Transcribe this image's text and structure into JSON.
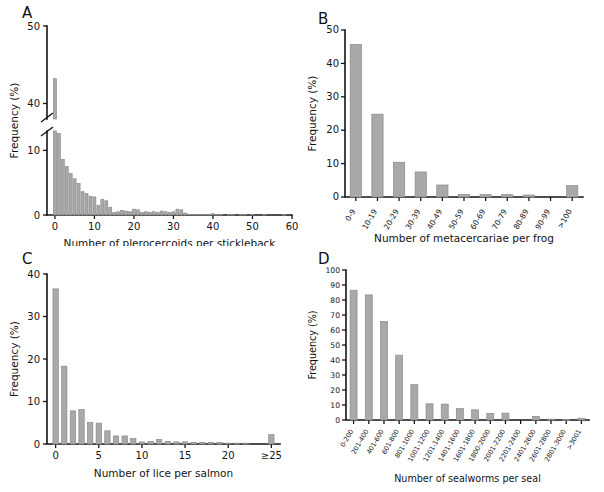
{
  "figure": {
    "title": "",
    "panels": [
      "A",
      "B",
      "C",
      "D"
    ]
  },
  "chart_data": [
    {
      "panel": "A",
      "type": "bar",
      "title": "A",
      "xlabel": "Number of plerocercoids per stickleback",
      "ylabel": "Frequency (%)",
      "xlim": [
        -2,
        60
      ],
      "ylim": [
        0,
        50
      ],
      "y_broken_axis": true,
      "y_break_lower": [
        0,
        13
      ],
      "y_break_upper": [
        38,
        50
      ],
      "yticks": [
        0,
        10,
        40,
        50
      ],
      "ytick_labels": [
        "0",
        "10",
        "40",
        "50"
      ],
      "xticks": [
        0,
        10,
        20,
        30,
        40,
        50,
        60
      ],
      "xtick_labels": [
        "0",
        "10",
        "20",
        "30",
        "40",
        "50",
        "60"
      ],
      "grid": false,
      "legend": "none",
      "categories": [
        0,
        1,
        2,
        3,
        4,
        5,
        6,
        7,
        8,
        9,
        10,
        11,
        12,
        13,
        14,
        15,
        16,
        17,
        18,
        19,
        20,
        21,
        22,
        23,
        24,
        25,
        26,
        27,
        28,
        29,
        30,
        31,
        32,
        33,
        34,
        35,
        36,
        37,
        38,
        39,
        40,
        41,
        42,
        43,
        44,
        45,
        46,
        47,
        48,
        49,
        50,
        51,
        52,
        53,
        54,
        55,
        56,
        57,
        58
      ],
      "values": [
        43.2,
        12.6,
        8.6,
        7.5,
        6.4,
        5.6,
        4.9,
        3.6,
        3.3,
        2.9,
        2.8,
        1.5,
        2.4,
        2.2,
        1.2,
        0.4,
        0.5,
        0.7,
        0.6,
        0.5,
        0.9,
        0.8,
        0.4,
        0.5,
        0.4,
        0.5,
        0.4,
        0.6,
        0.5,
        0.4,
        0.5,
        0.9,
        0.8,
        0.3,
        0.1,
        0.1,
        0.1,
        0.1,
        0.1,
        0.1,
        0.2,
        0.1,
        0.1,
        0.0,
        0.1,
        0.1,
        0.0,
        0.1,
        0.1,
        0.0,
        0.1,
        0.0,
        0.0,
        0.1,
        0.0,
        0.0,
        0.0,
        0.0,
        0.1
      ]
    },
    {
      "panel": "B",
      "type": "bar",
      "title": "B",
      "xlabel": "Number of metacercariae per frog",
      "ylabel": "Frequency (%)",
      "ylim": [
        0,
        50
      ],
      "yticks": [
        0,
        10,
        20,
        30,
        40,
        50
      ],
      "ytick_labels": [
        "0",
        "10",
        "20",
        "30",
        "40",
        "50"
      ],
      "grid": false,
      "legend": "none",
      "categories": [
        "0-9",
        "10-19",
        "20-29",
        "30-39",
        "40-49",
        "50-59",
        "60-69",
        "70-79",
        "80-89",
        "90-99",
        ">100"
      ],
      "values": [
        45.7,
        24.8,
        10.4,
        7.5,
        3.6,
        0.8,
        0.7,
        0.7,
        0.6,
        0.0,
        3.4
      ]
    },
    {
      "panel": "C",
      "type": "bar",
      "title": "C",
      "xlabel": "Number of lice per salmon",
      "ylabel": "Frequency (%)",
      "xlim": [
        -1,
        26
      ],
      "ylim": [
        0,
        40
      ],
      "yticks": [
        0,
        10,
        20,
        30,
        40
      ],
      "ytick_labels": [
        "0",
        "10",
        "20",
        "30",
        "40"
      ],
      "xticks": [
        0,
        5,
        10,
        15,
        20,
        25
      ],
      "xtick_labels": [
        "0",
        "5",
        "10",
        "15",
        "20",
        "≥25"
      ],
      "grid": false,
      "legend": "none",
      "categories": [
        0,
        1,
        2,
        3,
        4,
        5,
        6,
        7,
        8,
        9,
        10,
        11,
        12,
        13,
        14,
        15,
        16,
        17,
        18,
        19,
        20,
        21,
        22,
        25
      ],
      "values": [
        36.5,
        18.3,
        7.8,
        8.1,
        5.1,
        4.9,
        3.1,
        1.9,
        1.9,
        1.3,
        0.5,
        0.6,
        1.1,
        0.6,
        0.5,
        0.5,
        0.4,
        0.4,
        0.4,
        0.4,
        0.2,
        0.2,
        0.2,
        2.2
      ]
    },
    {
      "panel": "D",
      "type": "bar",
      "title": "D",
      "xlabel": "Number of sealworms per seal",
      "ylabel": "Frequency (%)",
      "ylim": [
        0,
        100
      ],
      "yticks": [
        0,
        10,
        20,
        30,
        40,
        50,
        60,
        70,
        80,
        90,
        100
      ],
      "ytick_labels": [
        "0",
        "10",
        "20",
        "30",
        "40",
        "50",
        "60",
        "70",
        "80",
        "90",
        "100"
      ],
      "grid": false,
      "legend": "none",
      "categories": [
        "0-200",
        "201-400",
        "401-600",
        "601-800",
        "801-1000",
        "1001-1200",
        "1201-1400",
        "1401-1600",
        "1601-1800",
        "1800-2000",
        "2001-2200",
        "2201-2400",
        "2401-2600",
        "2601-2800",
        "2801-3000",
        ">3001"
      ],
      "values": [
        86.5,
        83.4,
        65.6,
        43.2,
        23.6,
        10.8,
        10.6,
        7.6,
        6.8,
        4.4,
        4.6,
        0.0,
        2.4,
        0.6,
        0.4,
        1.2
      ]
    }
  ]
}
